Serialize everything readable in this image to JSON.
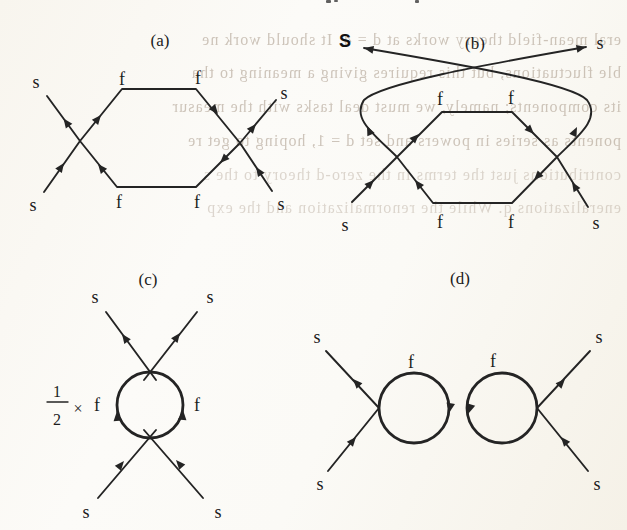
{
  "ghost_text": {
    "color": "#a08f7e",
    "lines": [
      "eral mean-field theory works at d = 4. It should work ne",
      "ble fluctuations, but this requires giving a meaning to tha",
      "its components; namely, we must deal tasks with the measur",
      "ponents as series in powers and set d = 1, hoping to get re",
      "contributions just the terms in the zero-d theory to the s",
      "eneralizations q. While the renormalization and the exp"
    ]
  },
  "panels": {
    "a": {
      "caption": "(a)",
      "f_labels": [
        "f",
        "f",
        "f",
        "f"
      ],
      "s_labels": [
        "s",
        "s",
        "s",
        "s"
      ]
    },
    "b": {
      "caption": "(b)",
      "f_labels": [
        "f",
        "f",
        "f",
        "f"
      ],
      "s_labels": [
        "S",
        "s",
        "s",
        "s"
      ]
    },
    "c": {
      "caption": "(c)",
      "prefactor": {
        "numerator": "1",
        "denominator": "2",
        "times": "×"
      },
      "f_labels": [
        "f",
        "f"
      ],
      "s_labels": [
        "s",
        "s",
        "s",
        "s"
      ]
    },
    "d": {
      "caption": "(d)",
      "f_labels": [
        "f",
        "f"
      ],
      "s_labels": [
        "s",
        "s",
        "s",
        "s"
      ]
    }
  },
  "ink_color": "#242424"
}
